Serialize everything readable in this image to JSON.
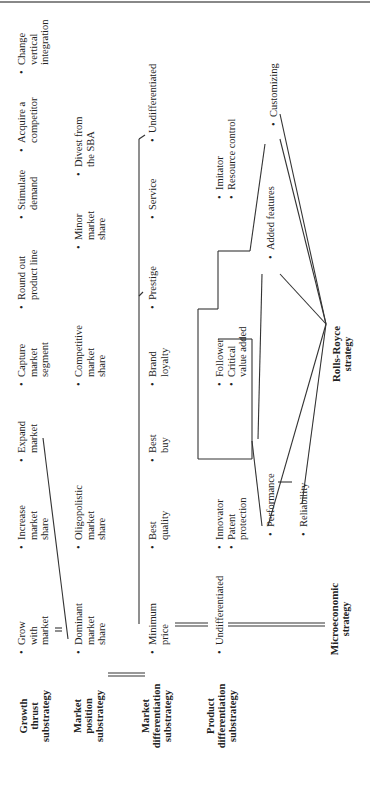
{
  "rows": [
    {
      "label": "Growth thrust substrategy",
      "items": [
        "Grow with market",
        "Increase market share",
        "Expand market",
        "Capture market segment",
        "Round out product line",
        "Stimulate demand",
        "Acquire a competitor",
        "Change vertical integration"
      ]
    },
    {
      "label": "Market position substrategy",
      "items": [
        "Dominant market share",
        "Oligopolistic market share",
        "Competitive market share",
        "Minor market share",
        "Divest from the SBA"
      ]
    },
    {
      "label": "Market differentiation substrategy",
      "items": [
        "Minimum price",
        "Best quality",
        "Best buy",
        "Brand loyalty",
        "Prestige",
        "Service",
        "Undifferentiated"
      ]
    },
    {
      "label": "Product differentiation substrategy",
      "items": [
        "Undifferentiated",
        "Innovator",
        "Patent protection",
        "Performance",
        "Reliability",
        "Follower",
        "Critical value added",
        "Added features",
        "Imitator",
        "Resource control",
        "Customizing"
      ]
    }
  ],
  "root": {
    "label": "Microeconomic strategy"
  },
  "target": {
    "label": "Rolls-Royce strategy"
  },
  "labels": {
    "growth_l1": "Growth",
    "growth_l2": "thrust",
    "growth_l3": "substrategy",
    "pos_l1": "Market",
    "pos_l2": "position",
    "pos_l3": "substrategy",
    "mdiff_l1": "Market",
    "mdiff_l2": "differentiation",
    "mdiff_l3": "substrategy",
    "pdiff_l1": "Product",
    "pdiff_l2": "differentiation",
    "pdiff_l3": "substrategy",
    "micro_l1": "Microeconomic",
    "micro_l2": "strategy",
    "rr_l1": "Rolls-Royce",
    "rr_l2": "strategy"
  },
  "nodes": {
    "g1a": "Grow",
    "g1b": "with",
    "g1c": "market",
    "g2a": "Increase",
    "g2b": "market",
    "g2c": "share",
    "g3a": "Expand",
    "g3b": "market",
    "g4a": "Capture",
    "g4b": "market",
    "g4c": "segment",
    "g5a": "Round out",
    "g5b": "product line",
    "g6a": "Stimulate",
    "g6b": "demand",
    "g7a": "Acquire a",
    "g7b": "competitor",
    "g8a": "Change",
    "g8b": "vertical",
    "g8c": "integration",
    "p1a": "Dominant",
    "p1b": "market",
    "p1c": "share",
    "p2a": "Oligopolistic",
    "p2b": "market",
    "p2c": "share",
    "p3a": "Competitive",
    "p3b": "market",
    "p3c": "share",
    "p4a": "Minor",
    "p4b": "market",
    "p4c": "share",
    "p5a": "Divest from",
    "p5b": "the SBA",
    "m1a": "Minimum",
    "m1b": "price",
    "m2a": "Best",
    "m2b": "quality",
    "m3a": "Best",
    "m3b": "buy",
    "m4a": "Brand",
    "m4b": "loyalty",
    "m5": "Prestige",
    "m6": "Service",
    "m7": "Undifferentiated",
    "d1": "Undifferentiated",
    "d2": "Innovator",
    "d3a": "Patent",
    "d3b": "protection",
    "d4": "Performance",
    "d5": "Reliability",
    "d6": "Follower",
    "d7a": "Critical",
    "d7b": "value added",
    "d8": "Added features",
    "d9": "Imitator",
    "d10": "Resource control",
    "d11": "Customizing"
  },
  "bullet": "•"
}
